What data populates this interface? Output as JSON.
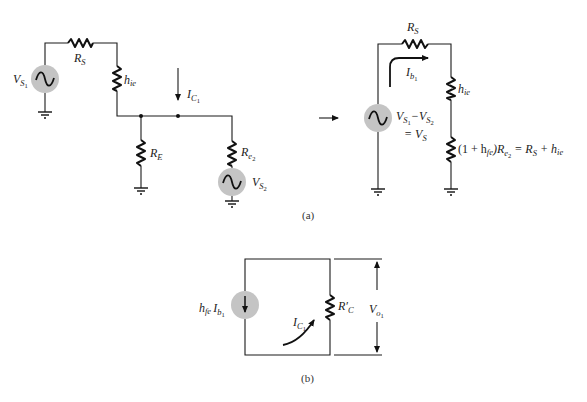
{
  "figure": {
    "a": {
      "caption": "(a)",
      "left_circuit": {
        "source1": {
          "label": "V",
          "sub": "S",
          "subsub": "1"
        },
        "rs": {
          "label": "R",
          "sub": "S"
        },
        "hie": {
          "label": "h",
          "sub": "ie"
        },
        "re": {
          "label": "R",
          "sub": "E"
        },
        "ic": {
          "label": "I",
          "sub": "C",
          "subsub": "1"
        },
        "re2": {
          "label": "R",
          "sub": "e",
          "subsub": "2"
        },
        "source2": {
          "label": "V",
          "sub": "S",
          "subsub": "2"
        }
      },
      "right_circuit": {
        "rs": {
          "label": "R",
          "sub": "S"
        },
        "ib": {
          "label": "I",
          "sub": "b",
          "subsub": "1"
        },
        "hie": {
          "label": "h",
          "sub": "ie"
        },
        "source_eq_line1_a": "V",
        "source_eq_line1_b": "−V",
        "source_eq_line2": "= V",
        "s": "S",
        "one": "1",
        "two": "2",
        "eq_open": "(1 + h",
        "eq_fe": "fe",
        "eq_close": ")R",
        "eq_e": "e",
        "eq_two": "2",
        "eq_eq": " = R",
        "eq_s": "S",
        "eq_plus": " + h",
        "eq_ie": "ie"
      }
    },
    "b": {
      "caption": "(b)",
      "source": {
        "label_h": "h",
        "sub_fe": "fe",
        "label_i": "I",
        "sub_b": "b",
        "subsub": "1"
      },
      "rc": {
        "label": "R′",
        "sub": "C"
      },
      "ic": {
        "label": "I",
        "sub": "C",
        "subsub": "1"
      },
      "vo": {
        "label": "V",
        "sub": "o",
        "subsub": "1"
      }
    }
  },
  "colors": {
    "wire": "#1a1a1a",
    "source_fill": "#c4c4c4",
    "background": "#ffffff"
  }
}
